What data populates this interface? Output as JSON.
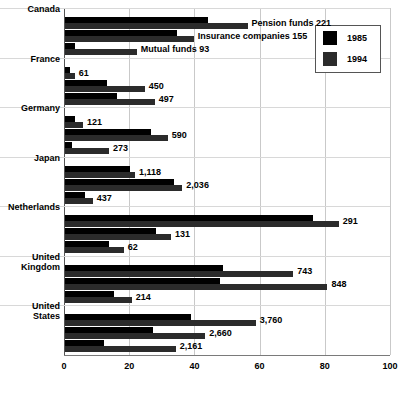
{
  "chart_data": {
    "type": "bar",
    "orientation": "horizontal",
    "title": "",
    "xlabel": "",
    "ylabel": "",
    "xlim": [
      0,
      100
    ],
    "xticks": [
      0,
      20,
      40,
      60,
      80,
      100
    ],
    "grid": true,
    "legend_position": "top-right",
    "series": [
      {
        "name": "1985",
        "color": "#000000"
      },
      {
        "name": "1994",
        "color": "#2b2b2b"
      }
    ],
    "categories": [
      "Pension funds",
      "Insurance companies",
      "Mutual funds"
    ],
    "groups": [
      {
        "country": "Canada",
        "rows": [
          {
            "category": "Pension funds",
            "label": "Pension funds  221",
            "value_label": "221",
            "y1985": 44.0,
            "y1994": 56.0
          },
          {
            "category": "Insurance companies",
            "label": "Insurance companies  155",
            "value_label": "155",
            "y1985": 34.5,
            "y1994": 39.5
          },
          {
            "category": "Mutual funds",
            "label": "Mutual funds  93",
            "value_label": "93",
            "y1985": 3.0,
            "y1994": 22.0
          }
        ]
      },
      {
        "country": "France",
        "rows": [
          {
            "category": "Pension funds",
            "label": "61",
            "value_label": "61",
            "y1985": 1.5,
            "y1994": 3.0
          },
          {
            "category": "Insurance companies",
            "label": "450",
            "value_label": "450",
            "y1985": 13.0,
            "y1994": 24.5
          },
          {
            "category": "Mutual funds",
            "label": "497",
            "value_label": "497",
            "y1985": 16.0,
            "y1994": 27.5
          }
        ]
      },
      {
        "country": "Germany",
        "rows": [
          {
            "category": "Pension funds",
            "label": "121",
            "value_label": "121",
            "y1985": 3.0,
            "y1994": 5.5
          },
          {
            "category": "Insurance companies",
            "label": "590",
            "value_label": "590",
            "y1985": 26.5,
            "y1994": 31.5
          },
          {
            "category": "Mutual funds",
            "label": "273",
            "value_label": "273",
            "y1985": 2.0,
            "y1994": 13.5
          }
        ]
      },
      {
        "country": "Japan",
        "rows": [
          {
            "category": "Pension funds",
            "label": "1,118",
            "value_label": "1,118",
            "y1985": 20.0,
            "y1994": 21.5
          },
          {
            "category": "Insurance companies",
            "label": "2,036",
            "value_label": "2,036",
            "y1985": 33.5,
            "y1994": 36.0
          },
          {
            "category": "Mutual funds",
            "label": "437",
            "value_label": "437",
            "y1985": 6.0,
            "y1994": 8.5
          }
        ]
      },
      {
        "country": "Netherlands",
        "rows": [
          {
            "category": "Pension funds",
            "label": "291",
            "value_label": "291",
            "y1985": 76.0,
            "y1994": 84.0
          },
          {
            "category": "Insurance companies",
            "label": "131",
            "value_label": "131",
            "y1985": 28.0,
            "y1994": 32.5
          },
          {
            "category": "Mutual funds",
            "label": "62",
            "value_label": "62",
            "y1985": 13.5,
            "y1994": 18.0
          }
        ]
      },
      {
        "country": "United Kingdom",
        "rows": [
          {
            "category": "Pension funds",
            "label": "743",
            "value_label": "743",
            "y1985": 48.5,
            "y1994": 70.0
          },
          {
            "category": "Insurance companies",
            "label": "848",
            "value_label": "848",
            "y1985": 47.5,
            "y1994": 80.5
          },
          {
            "category": "Mutual funds",
            "label": "214",
            "value_label": "214",
            "y1985": 15.0,
            "y1994": 20.5
          }
        ]
      },
      {
        "country": "United States",
        "rows": [
          {
            "category": "Pension funds",
            "label": "3,760",
            "value_label": "3,760",
            "y1985": 38.5,
            "y1994": 58.5
          },
          {
            "category": "Insurance companies",
            "label": "2,660",
            "value_label": "2,660",
            "y1985": 27.0,
            "y1994": 43.0
          },
          {
            "category": "Mutual funds",
            "label": "2,161",
            "value_label": "2,161",
            "y1985": 12.0,
            "y1994": 34.0
          }
        ]
      }
    ]
  }
}
